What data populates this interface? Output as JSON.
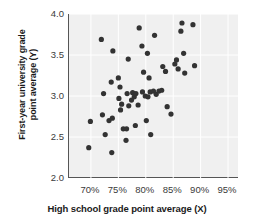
{
  "chart_data": {
    "type": "scatter",
    "title": "",
    "xlabel": "High school grade point average (X)",
    "ylabel_line1": "First-year university grade",
    "ylabel_line2": "point average (Y)",
    "ylabel": "First-year university grade point average (Y)",
    "xlim": [
      66,
      97
    ],
    "ylim": [
      2.0,
      4.0
    ],
    "xticks": [
      70,
      75,
      80,
      85,
      90,
      95
    ],
    "xtick_labels": [
      "70%",
      "75%",
      "80%",
      "85%",
      "90%",
      "95%"
    ],
    "yticks": [
      2.0,
      2.5,
      3.0,
      3.5,
      4.0
    ],
    "ytick_labels": [
      "2.0",
      "2.5",
      "3.0",
      "3.5",
      "4.0"
    ],
    "grid": true,
    "legend": null,
    "point_color": "#333333",
    "plot_background": "#f0f0f0",
    "axis_color": "#555555",
    "marker_size": 2.6,
    "n_points": 57,
    "points": [
      {
        "x": 69.9,
        "y": 2.69
      },
      {
        "x": 69.6,
        "y": 2.37
      },
      {
        "x": 71.9,
        "y": 3.69
      },
      {
        "x": 72.3,
        "y": 3.03
      },
      {
        "x": 72.1,
        "y": 2.77
      },
      {
        "x": 72.6,
        "y": 2.53
      },
      {
        "x": 73.3,
        "y": 2.7
      },
      {
        "x": 74.0,
        "y": 3.55
      },
      {
        "x": 73.7,
        "y": 3.17
      },
      {
        "x": 73.9,
        "y": 2.73
      },
      {
        "x": 73.8,
        "y": 2.31
      },
      {
        "x": 75.0,
        "y": 3.22
      },
      {
        "x": 75.3,
        "y": 3.11
      },
      {
        "x": 75.1,
        "y": 2.97
      },
      {
        "x": 75.6,
        "y": 2.9
      },
      {
        "x": 75.4,
        "y": 2.83
      },
      {
        "x": 75.9,
        "y": 2.6
      },
      {
        "x": 76.5,
        "y": 2.6
      },
      {
        "x": 76.8,
        "y": 3.45
      },
      {
        "x": 76.6,
        "y": 3.03
      },
      {
        "x": 76.9,
        "y": 2.88
      },
      {
        "x": 76.4,
        "y": 2.46
      },
      {
        "x": 77.6,
        "y": 3.04
      },
      {
        "x": 77.9,
        "y": 2.99
      },
      {
        "x": 77.4,
        "y": 2.95
      },
      {
        "x": 78.2,
        "y": 3.03
      },
      {
        "x": 78.6,
        "y": 2.89
      },
      {
        "x": 78.1,
        "y": 2.64
      },
      {
        "x": 78.8,
        "y": 3.83
      },
      {
        "x": 79.3,
        "y": 3.61
      },
      {
        "x": 79.6,
        "y": 3.29
      },
      {
        "x": 79.4,
        "y": 3.05
      },
      {
        "x": 79.9,
        "y": 3.0
      },
      {
        "x": 80.1,
        "y": 2.7
      },
      {
        "x": 80.6,
        "y": 3.22
      },
      {
        "x": 80.3,
        "y": 3.52
      },
      {
        "x": 80.8,
        "y": 3.05
      },
      {
        "x": 80.4,
        "y": 2.99
      },
      {
        "x": 80.9,
        "y": 2.53
      },
      {
        "x": 81.6,
        "y": 3.74
      },
      {
        "x": 81.4,
        "y": 3.06
      },
      {
        "x": 81.9,
        "y": 3.02
      },
      {
        "x": 82.4,
        "y": 3.06
      },
      {
        "x": 82.9,
        "y": 3.07
      },
      {
        "x": 83.1,
        "y": 3.36
      },
      {
        "x": 83.6,
        "y": 3.3
      },
      {
        "x": 83.9,
        "y": 2.87
      },
      {
        "x": 84.6,
        "y": 2.78
      },
      {
        "x": 85.3,
        "y": 3.39
      },
      {
        "x": 85.6,
        "y": 3.44
      },
      {
        "x": 85.9,
        "y": 3.33
      },
      {
        "x": 86.6,
        "y": 3.89
      },
      {
        "x": 86.4,
        "y": 3.79
      },
      {
        "x": 86.9,
        "y": 3.52
      },
      {
        "x": 87.1,
        "y": 3.28
      },
      {
        "x": 88.6,
        "y": 3.87
      },
      {
        "x": 88.9,
        "y": 3.37
      }
    ]
  }
}
